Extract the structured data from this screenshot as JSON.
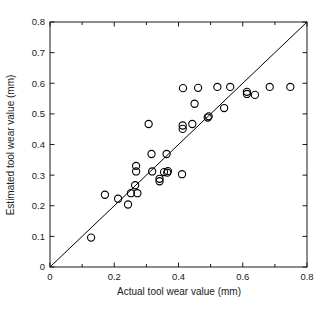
{
  "chart_data": {
    "type": "scatter",
    "title": "",
    "xlabel": "Actual tool wear value (mm)",
    "ylabel": "Estimated tool wear value (mm)",
    "xlim": [
      0,
      0.8
    ],
    "ylim": [
      0,
      0.8
    ],
    "grid": false,
    "legend": null,
    "xticks": [
      0,
      0.1,
      0.2,
      0.3,
      0.4,
      0.5,
      0.6,
      0.7,
      0.8
    ],
    "xtick_labels": [
      "0",
      "",
      "0.2",
      "",
      "0.4",
      "",
      "0.6",
      "",
      "0.8"
    ],
    "yticks": [
      0,
      0.1,
      0.2,
      0.3,
      0.4,
      0.5,
      0.6,
      0.7,
      0.8
    ],
    "ytick_labels": [
      "0",
      "0.1",
      "0.2",
      "0.3",
      "0.4",
      "0.5",
      "0.6",
      "0.7",
      "0.8"
    ],
    "marker": "open-circle",
    "marker_color": "#000000",
    "reference_line": {
      "name": "y = x identity line",
      "from": [
        0,
        0
      ],
      "to": [
        0.8,
        0.8
      ],
      "color": "#000000"
    },
    "series": [
      {
        "name": "Estimated vs actual tool wear",
        "points": [
          [
            0.128,
            0.096
          ],
          [
            0.171,
            0.236
          ],
          [
            0.212,
            0.223
          ],
          [
            0.243,
            0.204
          ],
          [
            0.252,
            0.241
          ],
          [
            0.265,
            0.267
          ],
          [
            0.268,
            0.33
          ],
          [
            0.268,
            0.312
          ],
          [
            0.272,
            0.241
          ],
          [
            0.307,
            0.467
          ],
          [
            0.316,
            0.369
          ],
          [
            0.318,
            0.312
          ],
          [
            0.341,
            0.288
          ],
          [
            0.341,
            0.28
          ],
          [
            0.355,
            0.31
          ],
          [
            0.363,
            0.369
          ],
          [
            0.365,
            0.308
          ],
          [
            0.367,
            0.313
          ],
          [
            0.411,
            0.303
          ],
          [
            0.413,
            0.462
          ],
          [
            0.413,
            0.451
          ],
          [
            0.414,
            0.584
          ],
          [
            0.443,
            0.467
          ],
          [
            0.45,
            0.533
          ],
          [
            0.461,
            0.585
          ],
          [
            0.491,
            0.488
          ],
          [
            0.494,
            0.492
          ],
          [
            0.521,
            0.588
          ],
          [
            0.542,
            0.519
          ],
          [
            0.561,
            0.588
          ],
          [
            0.613,
            0.565
          ],
          [
            0.613,
            0.572
          ],
          [
            0.638,
            0.562
          ],
          [
            0.684,
            0.588
          ],
          [
            0.748,
            0.588
          ]
        ]
      }
    ]
  },
  "axes": {
    "frame_color": "#1a1a1a",
    "background": "#ffffff"
  }
}
